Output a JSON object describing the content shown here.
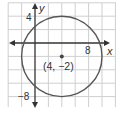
{
  "graph": {
    "x_axis_label": "x",
    "y_axis_label": "y",
    "tick_labels": {
      "y_top": "4",
      "x_right": "8",
      "y_bottom": "−8"
    },
    "center_label": "(4, −2)",
    "circle": {
      "center": [
        4,
        -2
      ],
      "radius": 6
    },
    "grid_step_units": 2,
    "x_range": [
      -4,
      12
    ],
    "y_range": [
      -10,
      6
    ],
    "colors": {
      "grid": "#cfcfcf",
      "axis": "#333333",
      "circle": "#555555",
      "center_dot": "#444444"
    }
  }
}
